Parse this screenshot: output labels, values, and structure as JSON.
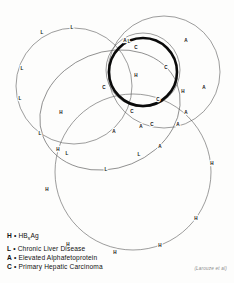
{
  "figure": {
    "background_color": "#fdfdfc",
    "ink_color": "#111111",
    "thin_stroke_color": "#5a5a5a",
    "thick_stroke_color": "#0a0a0a"
  },
  "chart_data": {
    "type": "venn",
    "title": "",
    "xlabel": "",
    "ylabel": "",
    "set_keys": [
      "H",
      "L",
      "A",
      "C"
    ],
    "sets": [
      {
        "key": "L",
        "name": "Chronic Liver Disease",
        "shape": "circle",
        "cx": 74,
        "cy": 86,
        "rx": 58,
        "ry": 58,
        "rotate": 0,
        "stroke": "thin",
        "marker_count": 9
      },
      {
        "key": "L",
        "name": "Chronic Liver Disease",
        "shape": "ellipse",
        "cx": 110,
        "cy": 110,
        "rx": 72,
        "ry": 58,
        "rotate": -22,
        "stroke": "thin",
        "marker_count": 9
      },
      {
        "key": "A",
        "name": "Elevated Alphafetoprotein",
        "shape": "circle",
        "cx": 164,
        "cy": 72,
        "rx": 56,
        "ry": 56,
        "rotate": 0,
        "stroke": "thin",
        "marker_count": 8
      },
      {
        "key": "A",
        "name": "Elevated Alphafetoprotein",
        "shape": "circle",
        "cx": 143,
        "cy": 70,
        "rx": 37,
        "ry": 37,
        "rotate": 0,
        "stroke": "thin",
        "marker_count": 7
      },
      {
        "key": "H",
        "name": "HBsAg",
        "shape": "circle",
        "cx": 133,
        "cy": 172,
        "rx": 78,
        "ry": 78,
        "rotate": 0,
        "stroke": "thin",
        "marker_count": 9
      },
      {
        "key": "C",
        "name": "Primary Hepatic Carcinoma",
        "shape": "circle",
        "cx": 143,
        "cy": 72,
        "rx": 34,
        "ry": 34,
        "rotate": 0,
        "stroke": "thick",
        "marker_count": 4
      }
    ],
    "markers": [
      {
        "label": "L",
        "x": 72,
        "y": 28
      },
      {
        "label": "L",
        "x": 42,
        "y": 33
      },
      {
        "label": "L",
        "x": 22,
        "y": 69
      },
      {
        "label": "L",
        "x": 20,
        "y": 99
      },
      {
        "label": "L",
        "x": 40,
        "y": 134
      },
      {
        "label": "L",
        "x": 67,
        "y": 154
      },
      {
        "label": "L",
        "x": 106,
        "y": 170
      },
      {
        "label": "L",
        "x": 139,
        "y": 155
      },
      {
        "label": "L",
        "x": 129,
        "y": 42
      },
      {
        "label": "A",
        "x": 125,
        "y": 41
      },
      {
        "label": "A",
        "x": 186,
        "y": 41
      },
      {
        "label": "A",
        "x": 204,
        "y": 88
      },
      {
        "label": "A",
        "x": 178,
        "y": 125
      },
      {
        "label": "A",
        "x": 141,
        "y": 127
      },
      {
        "label": "A",
        "x": 160,
        "y": 147
      },
      {
        "label": "A",
        "x": 186,
        "y": 113
      },
      {
        "label": "A",
        "x": 114,
        "y": 132
      },
      {
        "label": "C",
        "x": 136,
        "y": 48
      },
      {
        "label": "C",
        "x": 166,
        "y": 68
      },
      {
        "label": "C",
        "x": 104,
        "y": 88
      },
      {
        "label": "C",
        "x": 132,
        "y": 112
      },
      {
        "label": "C",
        "x": 158,
        "y": 100
      },
      {
        "label": "C",
        "x": 152,
        "y": 125
      },
      {
        "label": "H",
        "x": 136,
        "y": 76
      },
      {
        "label": "H",
        "x": 61,
        "y": 113
      },
      {
        "label": "H",
        "x": 183,
        "y": 92
      },
      {
        "label": "H",
        "x": 212,
        "y": 164
      },
      {
        "label": "H",
        "x": 196,
        "y": 219
      },
      {
        "label": "H",
        "x": 160,
        "y": 246
      },
      {
        "label": "H",
        "x": 115,
        "y": 253
      },
      {
        "label": "H",
        "x": 68,
        "y": 245
      },
      {
        "label": "H",
        "x": 47,
        "y": 190
      },
      {
        "label": "H",
        "x": 58,
        "y": 150
      }
    ]
  },
  "legend": {
    "rows": [
      {
        "key": "H",
        "sep": "•",
        "pre": "HB",
        "sub": "s",
        "post": "Ag",
        "text": "HBsAg"
      },
      {
        "key": "L",
        "sep": "•",
        "text": "Chronic Liver Disease"
      },
      {
        "key": "A",
        "sep": "•",
        "text": "Elevated Alphafetoprotein"
      },
      {
        "key": "C",
        "sep": "•",
        "text": "Primary Hepatic Carcinoma"
      }
    ]
  },
  "attribution": {
    "text": "(Larouze et al)"
  }
}
